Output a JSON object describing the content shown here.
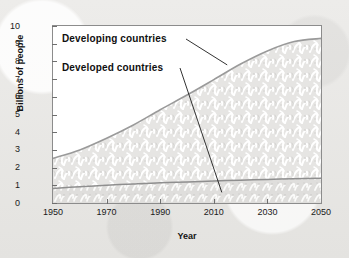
{
  "chart_data": {
    "type": "area",
    "title": "",
    "subtitle": "",
    "xlabel": "Year",
    "ylabel": "Billions of people",
    "xlim": [
      1950,
      2050
    ],
    "ylim": [
      0,
      10
    ],
    "grid": false,
    "legend_position": "inline-annotations",
    "stacked": true,
    "x_ticks": [
      "1950",
      "1970",
      "1990",
      "2010",
      "2030",
      "2050"
    ],
    "x_tick_values": [
      1950,
      1970,
      1990,
      2010,
      2030,
      2050
    ],
    "y_ticks": [
      "0",
      "1",
      "2",
      "3",
      "4",
      "5",
      "6",
      "7",
      "8",
      "9",
      "10"
    ],
    "y_tick_values": [
      0,
      1,
      2,
      3,
      4,
      5,
      6,
      7,
      8,
      9,
      10
    ],
    "x": [
      1950,
      1960,
      1970,
      1980,
      1990,
      2000,
      2010,
      2020,
      2030,
      2040,
      2050
    ],
    "series": [
      {
        "name": "Developed countries",
        "values": [
          0.82,
          0.92,
          1.0,
          1.08,
          1.15,
          1.19,
          1.24,
          1.29,
          1.33,
          1.37,
          1.4
        ]
      },
      {
        "name": "Developing countries",
        "values": [
          1.7,
          2.08,
          2.66,
          3.33,
          4.12,
          4.91,
          5.73,
          6.56,
          7.26,
          7.75,
          7.9
        ]
      }
    ],
    "cumulative_total": [
      2.52,
      3.0,
      3.66,
      4.41,
      5.27,
      6.1,
      6.97,
      7.85,
      8.59,
      9.12,
      9.3
    ],
    "annotations": [
      {
        "label": "Developing countries",
        "points_to_series": "Developing countries",
        "points_to_x": 2015,
        "points_to_y": 7.8
      },
      {
        "label": "Developed countries",
        "points_to_series": "Developed countries",
        "points_to_x": 2013,
        "points_to_y": 0.6
      }
    ],
    "colors": {
      "developing_fill": "#e3e2e0",
      "developed_fill": "#dedddb",
      "curve_stroke": "#9a9a9a",
      "frame": "#8c8c8c",
      "text": "#101010",
      "background": "#ffffff",
      "page_background": "#e9e8e6"
    }
  }
}
